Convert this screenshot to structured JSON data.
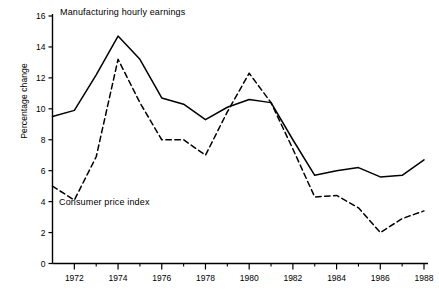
{
  "chart_data": {
    "type": "line",
    "title": "",
    "subtitle": "",
    "xlabel": "",
    "ylabel": "Percentage change",
    "xlim": [
      1971,
      1988
    ],
    "ylim": [
      0,
      16
    ],
    "ytick_step": 2,
    "grid": false,
    "legend_position": "inline-annotations",
    "x": [
      1971,
      1972,
      1973,
      1974,
      1975,
      1976,
      1977,
      1978,
      1979,
      1980,
      1981,
      1982,
      1983,
      1984,
      1985,
      1986,
      1987,
      1988
    ],
    "xticks_major": [
      1972,
      1974,
      1976,
      1978,
      1980,
      1982,
      1984,
      1986,
      1988
    ],
    "xticks_minor": [
      1971,
      1973,
      1975,
      1977,
      1979,
      1981,
      1983,
      1985,
      1987
    ],
    "xtick_labels": [
      "1972",
      "1974",
      "1976",
      "1978",
      "1980",
      "1982",
      "1984",
      "1986",
      "1988"
    ],
    "ytick_labels": [
      "0",
      "2",
      "4",
      "6",
      "8",
      "10",
      "12",
      "14",
      "16"
    ],
    "yticks": [
      0,
      2,
      4,
      6,
      8,
      10,
      12,
      14,
      16
    ],
    "series": [
      {
        "name": "Manufacturing hourly earnings",
        "style": "solid",
        "color": "#000000",
        "values": [
          9.5,
          9.9,
          12.2,
          14.7,
          13.2,
          10.7,
          10.3,
          9.3,
          10.1,
          10.6,
          10.4,
          8.0,
          5.7,
          6.0,
          6.2,
          5.6,
          5.7,
          6.7
        ]
      },
      {
        "name": "Consumer price index",
        "style": "dashed",
        "color": "#000000",
        "values": [
          5.0,
          4.1,
          6.9,
          13.2,
          10.4,
          8.0,
          8.0,
          7.0,
          9.8,
          12.3,
          10.4,
          7.4,
          4.3,
          4.4,
          3.6,
          2.0,
          2.9,
          3.4
        ]
      }
    ],
    "annotations": [
      {
        "text": "Manufacturing hourly earnings",
        "x": 1971.3,
        "y": 15.6
      },
      {
        "text": "Consumer price index",
        "x": 1971.3,
        "y": 3.6
      }
    ]
  },
  "axis": {
    "y_title": "Percentage change"
  },
  "labels": {
    "manufacturing": "Manufacturing hourly earnings",
    "cpi": "Consumer price index"
  }
}
